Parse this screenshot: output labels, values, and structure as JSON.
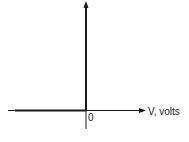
{
  "diagram": {
    "type": "current-voltage characteristic axes",
    "x_axis": {
      "label": "V, volts",
      "arrow": "right"
    },
    "y_axis": {
      "label": "",
      "arrow": "up"
    },
    "origin_label": "0",
    "curve": {
      "description": "thick line along negative V axis up to origin, then vertical along positive current axis",
      "segments": [
        {
          "from": "left end of V axis",
          "to": "origin"
        },
        {
          "from": "origin",
          "to": "top of vertical axis"
        }
      ]
    },
    "colors": {
      "line": "#1a1a1a",
      "background": "#ffffff"
    }
  }
}
